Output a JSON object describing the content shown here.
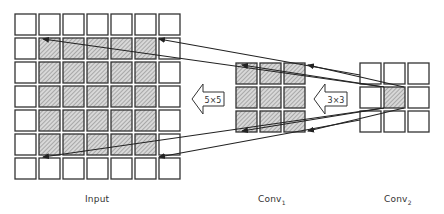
{
  "labels": {
    "input": "Input",
    "conv1": "Conv",
    "conv1_sub": "1",
    "conv2": "Conv",
    "conv2_sub": "2",
    "arrow_5x5": "5×5",
    "arrow_3x3": "3×3"
  },
  "grids": {
    "input": {
      "rows": 7,
      "cols": 7,
      "hatched_region": "rows 1-5, cols 1-5"
    },
    "conv1": {
      "rows": 3,
      "cols": 3,
      "hatched_region": "all"
    },
    "conv2": {
      "rows": 3,
      "cols": 3,
      "hatched_region": "center cell"
    }
  },
  "colors": {
    "stroke": "#333333",
    "hatch": "#9a9a9a",
    "hatch_bg": "#d8d8d8"
  }
}
